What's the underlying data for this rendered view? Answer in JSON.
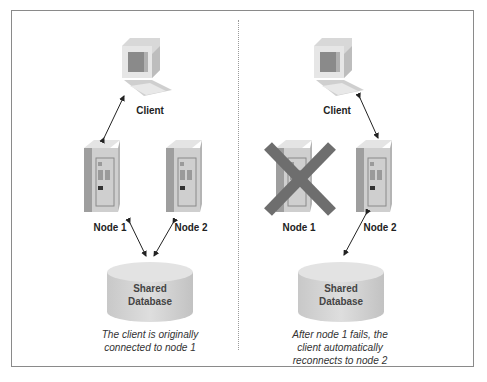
{
  "left_panel": {
    "client_label": "Client",
    "node1_label": "Node 1",
    "node2_label": "Node 2",
    "database_label_line1": "Shared",
    "database_label_line2": "Database",
    "caption_line1": "The client is originally",
    "caption_line2": "connected to node 1"
  },
  "right_panel": {
    "client_label": "Client",
    "node1_label": "Node 1",
    "node2_label": "Node 2",
    "database_label_line1": "Shared",
    "database_label_line2": "Database",
    "caption_line1": "After node 1 fails, the",
    "caption_line2": "client automatically",
    "caption_line3": "reconnects to node 2",
    "failed_marker": "X"
  },
  "colors": {
    "failure_x": "#6e6e6e",
    "device_light": "#e2e2e2",
    "device_mid": "#c4c4c4",
    "device_dark": "#9a9a9a"
  }
}
